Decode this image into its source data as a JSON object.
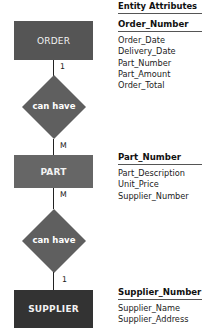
{
  "title": "Entity Attributes",
  "colors": {
    "order": "#555555",
    "part": "#666666",
    "supplier": "#333333",
    "diamond": "#5f5f5f"
  },
  "entities": [
    {
      "name": "ORDER",
      "key": "Order_Number",
      "attributes": [
        "Order_Date",
        "Delivery_Date",
        "Part_Number",
        "Part_Amount",
        "Order_Total"
      ]
    },
    {
      "name": "PART",
      "key": "Part_Number",
      "attributes": [
        "Part_Description",
        "Unit_Price",
        "Supplier_Number"
      ]
    },
    {
      "name": "SUPPLIER",
      "key": "Supplier_Number",
      "attributes": [
        "Supplier_Name",
        "Supplier_Address"
      ]
    }
  ],
  "relationships": [
    {
      "label": "can have",
      "from_card": "1",
      "to_card": "M"
    },
    {
      "label": "can have",
      "from_card": "M",
      "to_card": "1"
    }
  ]
}
